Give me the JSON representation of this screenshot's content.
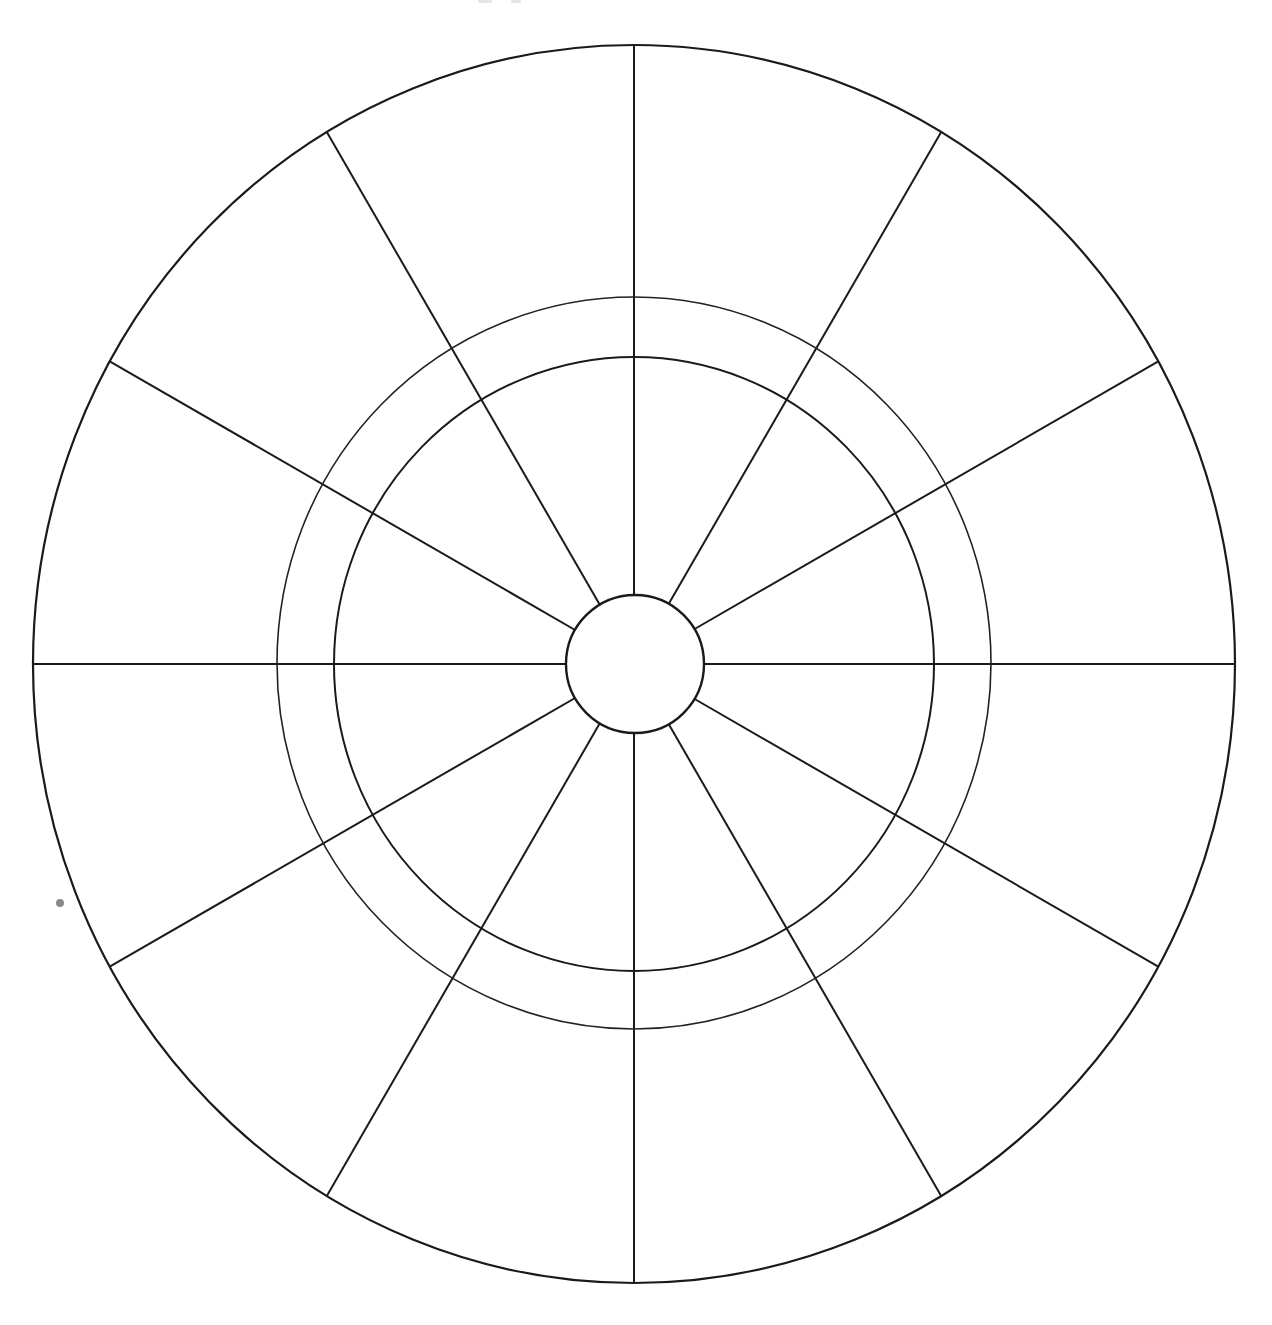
{
  "diagram": {
    "title": "",
    "type": "blank-wheel-template",
    "segments": 12,
    "rings": [
      "outer-boundary",
      "middle-ring",
      "inner-ring",
      "center-hub"
    ],
    "segment_labels": [
      "",
      "",
      "",
      "",
      "",
      "",
      "",
      "",
      "",
      "",
      "",
      ""
    ],
    "hub_label": "",
    "colors": {
      "line": "#1a1a1a",
      "background": "#ffffff",
      "artifact": "#8a8a8a"
    }
  }
}
